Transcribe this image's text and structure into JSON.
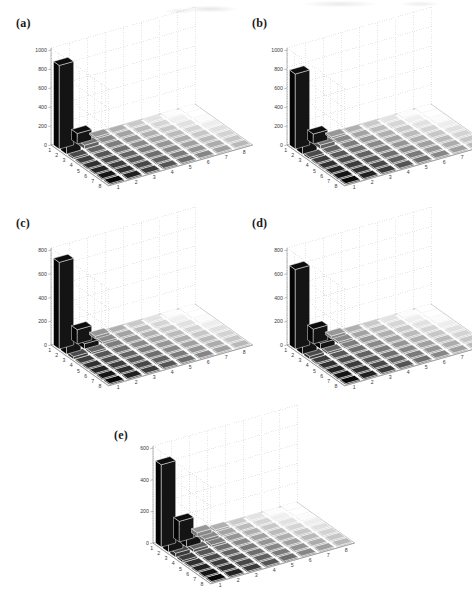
{
  "figure": {
    "type": "multi-panel-3d-bar-figure",
    "panel_count": 5,
    "layout": "2 x 2 grid plus one centered panel below"
  },
  "panels": [
    {
      "tag": "(a)",
      "ylim": [
        0,
        1000
      ],
      "yticks": [
        "0",
        "200",
        "400",
        "600",
        "800",
        "1000"
      ],
      "xticks_left": [
        "1",
        "2",
        "3",
        "4",
        "5",
        "6",
        "7",
        "8"
      ],
      "xticks_right": [
        "1",
        "2",
        "3",
        "4",
        "5",
        "6",
        "7",
        "8"
      ],
      "peak_value": 880,
      "second_value": 110
    },
    {
      "tag": "(b)",
      "ylim": [
        0,
        1000
      ],
      "yticks": [
        "0",
        "200",
        "400",
        "600",
        "800",
        "1000"
      ],
      "xticks_left": [
        "1",
        "2",
        "3",
        "4",
        "5",
        "6",
        "7",
        "8"
      ],
      "xticks_right": [
        "1",
        "2",
        "3",
        "4",
        "5",
        "6",
        "7",
        "8"
      ],
      "peak_value": 790,
      "second_value": 105
    },
    {
      "tag": "(c)",
      "ylim": [
        0,
        800
      ],
      "yticks": [
        "0",
        "200",
        "400",
        "600",
        "800"
      ],
      "xticks_left": [
        "1",
        "2",
        "3",
        "4",
        "5",
        "6",
        "7",
        "8"
      ],
      "xticks_right": [
        "1",
        "2",
        "3",
        "4",
        "5",
        "6",
        "7",
        "8"
      ],
      "peak_value": 730,
      "second_value": 120
    },
    {
      "tag": "(d)",
      "ylim": [
        0,
        800
      ],
      "yticks": [
        "0",
        "200",
        "400",
        "600",
        "800"
      ],
      "xticks_left": [
        "1",
        "2",
        "3",
        "4",
        "5",
        "6",
        "7",
        "8"
      ],
      "xticks_right": [
        "1",
        "2",
        "3",
        "4",
        "5",
        "6",
        "7",
        "8"
      ],
      "peak_value": 670,
      "second_value": 125
    },
    {
      "tag": "(e)",
      "ylim": [
        0,
        600
      ],
      "yticks": [
        "0",
        "200",
        "400",
        "600"
      ],
      "xticks_left": [
        "1",
        "2",
        "3",
        "4",
        "5",
        "6",
        "7",
        "8"
      ],
      "xticks_right": [
        "1",
        "2",
        "3",
        "4",
        "5",
        "6",
        "7",
        "8"
      ],
      "peak_value": 520,
      "second_value": 130
    }
  ],
  "chart_data": [
    {
      "type": "bar",
      "title": "(a)",
      "xlabel": "",
      "ylabel": "",
      "zlabel": "",
      "ylim": [
        0,
        1000
      ],
      "yticks": [
        0,
        200,
        400,
        600,
        800,
        1000
      ],
      "categories_x": [
        1,
        2,
        3,
        4,
        5,
        6,
        7,
        8
      ],
      "categories_y": [
        1,
        2,
        3,
        4,
        5,
        6,
        7,
        8
      ],
      "grid": true,
      "legend": "none",
      "matrix": [
        [
          880,
          110,
          18,
          9,
          5,
          3,
          2,
          1
        ],
        [
          110,
          40,
          14,
          7,
          4,
          3,
          2,
          1
        ],
        [
          18,
          14,
          10,
          6,
          4,
          2,
          2,
          1
        ],
        [
          9,
          7,
          6,
          5,
          3,
          2,
          1,
          1
        ],
        [
          5,
          4,
          4,
          3,
          2,
          2,
          1,
          1
        ],
        [
          3,
          3,
          2,
          2,
          2,
          1,
          1,
          0
        ],
        [
          2,
          2,
          2,
          1,
          1,
          1,
          1,
          0
        ],
        [
          1,
          1,
          1,
          1,
          1,
          0,
          0,
          0
        ]
      ]
    },
    {
      "type": "bar",
      "title": "(b)",
      "ylim": [
        0,
        1000
      ],
      "yticks": [
        0,
        200,
        400,
        600,
        800,
        1000
      ],
      "categories_x": [
        1,
        2,
        3,
        4,
        5,
        6,
        7,
        8
      ],
      "categories_y": [
        1,
        2,
        3,
        4,
        5,
        6,
        7,
        8
      ],
      "grid": true,
      "legend": "none",
      "matrix": [
        [
          790,
          105,
          20,
          10,
          5,
          3,
          2,
          1
        ],
        [
          105,
          42,
          15,
          8,
          4,
          3,
          2,
          1
        ],
        [
          20,
          15,
          11,
          6,
          4,
          3,
          2,
          1
        ],
        [
          10,
          8,
          6,
          5,
          3,
          2,
          1,
          1
        ],
        [
          5,
          4,
          4,
          3,
          2,
          2,
          1,
          1
        ],
        [
          3,
          3,
          3,
          2,
          2,
          1,
          1,
          0
        ],
        [
          2,
          2,
          2,
          1,
          1,
          1,
          1,
          0
        ],
        [
          1,
          1,
          1,
          1,
          1,
          0,
          0,
          0
        ]
      ]
    },
    {
      "type": "bar",
      "title": "(c)",
      "ylim": [
        0,
        800
      ],
      "yticks": [
        0,
        200,
        400,
        600,
        800
      ],
      "categories_x": [
        1,
        2,
        3,
        4,
        5,
        6,
        7,
        8
      ],
      "categories_y": [
        1,
        2,
        3,
        4,
        5,
        6,
        7,
        8
      ],
      "grid": true,
      "legend": "none",
      "matrix": [
        [
          730,
          120,
          22,
          10,
          6,
          3,
          2,
          1
        ],
        [
          120,
          45,
          16,
          8,
          5,
          3,
          2,
          1
        ],
        [
          22,
          16,
          11,
          7,
          4,
          3,
          2,
          1
        ],
        [
          10,
          8,
          7,
          5,
          3,
          2,
          2,
          1
        ],
        [
          6,
          5,
          4,
          3,
          3,
          2,
          1,
          1
        ],
        [
          3,
          3,
          3,
          2,
          2,
          1,
          1,
          1
        ],
        [
          2,
          2,
          2,
          2,
          1,
          1,
          1,
          0
        ],
        [
          1,
          1,
          1,
          1,
          1,
          1,
          0,
          0
        ]
      ]
    },
    {
      "type": "bar",
      "title": "(d)",
      "ylim": [
        0,
        800
      ],
      "yticks": [
        0,
        200,
        400,
        600,
        800
      ],
      "categories_x": [
        1,
        2,
        3,
        4,
        5,
        6,
        7,
        8
      ],
      "categories_y": [
        1,
        2,
        3,
        4,
        5,
        6,
        7,
        8
      ],
      "grid": true,
      "legend": "none",
      "matrix": [
        [
          670,
          125,
          24,
          11,
          6,
          4,
          2,
          1
        ],
        [
          125,
          48,
          17,
          9,
          5,
          3,
          2,
          1
        ],
        [
          24,
          17,
          12,
          7,
          4,
          3,
          2,
          1
        ],
        [
          11,
          9,
          7,
          5,
          4,
          2,
          2,
          1
        ],
        [
          6,
          5,
          4,
          4,
          3,
          2,
          1,
          1
        ],
        [
          4,
          3,
          3,
          2,
          2,
          2,
          1,
          1
        ],
        [
          2,
          2,
          2,
          2,
          1,
          1,
          1,
          1
        ],
        [
          1,
          1,
          1,
          1,
          1,
          1,
          1,
          0
        ]
      ]
    },
    {
      "type": "bar",
      "title": "(e)",
      "ylim": [
        0,
        600
      ],
      "yticks": [
        0,
        200,
        400,
        600
      ],
      "categories_x": [
        1,
        2,
        3,
        4,
        5,
        6,
        7,
        8
      ],
      "categories_y": [
        1,
        2,
        3,
        4,
        5,
        6,
        7,
        8
      ],
      "grid": true,
      "legend": "none",
      "matrix": [
        [
          520,
          130,
          26,
          12,
          7,
          4,
          2,
          1
        ],
        [
          130,
          50,
          18,
          9,
          5,
          3,
          2,
          1
        ],
        [
          26,
          18,
          13,
          8,
          5,
          3,
          2,
          1
        ],
        [
          12,
          9,
          8,
          6,
          4,
          3,
          2,
          1
        ],
        [
          7,
          5,
          5,
          4,
          3,
          2,
          2,
          1
        ],
        [
          4,
          3,
          3,
          3,
          2,
          2,
          1,
          1
        ],
        [
          2,
          2,
          2,
          2,
          2,
          1,
          1,
          1
        ],
        [
          1,
          1,
          1,
          1,
          1,
          1,
          1,
          1
        ]
      ]
    }
  ],
  "style": {
    "background": "#ffffff",
    "grid_color": "#cfcfcf",
    "axis_color": "#8a8a8a",
    "tick_text_color": "#3a3a3a",
    "bar_color": "#0d0d0d",
    "tile_edge_color": "#ffffff"
  }
}
